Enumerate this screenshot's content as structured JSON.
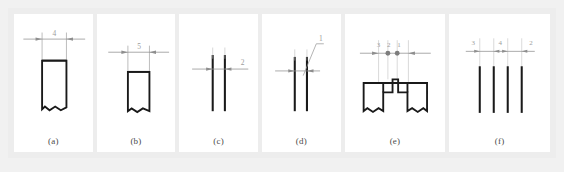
{
  "figure": {
    "panel_count": 6,
    "colors": {
      "page_background": "#f1f1f1",
      "band_background": "#ededed",
      "panel_background": "#ffffff",
      "profile_stroke": "#1a1a1a",
      "dimension_stroke": "#8e8e8e",
      "label_text": "#8a8a8a",
      "caption_text": "#4a4a4a",
      "node_fill": "#7d7d7d"
    },
    "panels": [
      {
        "id": "a",
        "caption": "(a)",
        "type": "single-rib-wide",
        "dimension_labels": [
          "4"
        ],
        "profile": "single tall rectangle open at bottom with break line",
        "bar_count": 1
      },
      {
        "id": "b",
        "caption": "(b)",
        "type": "single-rib-narrow",
        "dimension_labels": [
          "5"
        ],
        "profile": "single tall rectangle open at bottom with break line",
        "bar_count": 1
      },
      {
        "id": "c",
        "caption": "(c)",
        "type": "twin-line-pair",
        "dimension_labels": [
          "2"
        ],
        "profile": "two thin vertical lines with horizontal dimension line",
        "bar_count": 2
      },
      {
        "id": "d",
        "caption": "(d)",
        "type": "twin-line-leader",
        "dimension_labels": [
          "1"
        ],
        "profile": "two thin vertical lines with angled leader line to label",
        "bar_count": 2
      },
      {
        "id": "e",
        "caption": "(e)",
        "type": "castellated-profile",
        "dimension_labels": [
          "3",
          "2",
          "1"
        ],
        "profile": "stepped castellated section, two outer blocks and two central teeth",
        "bar_count": 4,
        "node_count": 2
      },
      {
        "id": "f",
        "caption": "(f)",
        "type": "quad-line-array",
        "dimension_labels": [
          "3",
          "4",
          "2"
        ],
        "profile": "four thin vertical lines with dimension chain above",
        "bar_count": 4
      }
    ]
  }
}
